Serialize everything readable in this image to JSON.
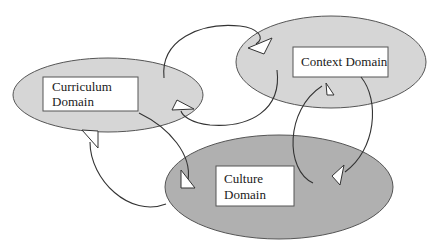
{
  "diagram": {
    "nodes": [
      {
        "id": "curriculum",
        "line1": "Curriculum",
        "line2": "Domain",
        "fill": "#d6d6d6"
      },
      {
        "id": "context",
        "line1": "Context Domain",
        "line2": "",
        "fill": "#d6d6d6"
      },
      {
        "id": "culture",
        "line1": "Culture",
        "line2": "Domain",
        "fill": "#b0b0b0"
      }
    ],
    "edges": [
      {
        "from": "curriculum",
        "to": "context"
      },
      {
        "from": "context",
        "to": "curriculum"
      },
      {
        "from": "context",
        "to": "culture"
      },
      {
        "from": "culture",
        "to": "context"
      },
      {
        "from": "culture",
        "to": "curriculum"
      },
      {
        "from": "curriculum",
        "to": "culture"
      }
    ],
    "colors": {
      "outline": "#555555",
      "arrow_line": "#333333",
      "box_fill": "#ffffff"
    }
  }
}
